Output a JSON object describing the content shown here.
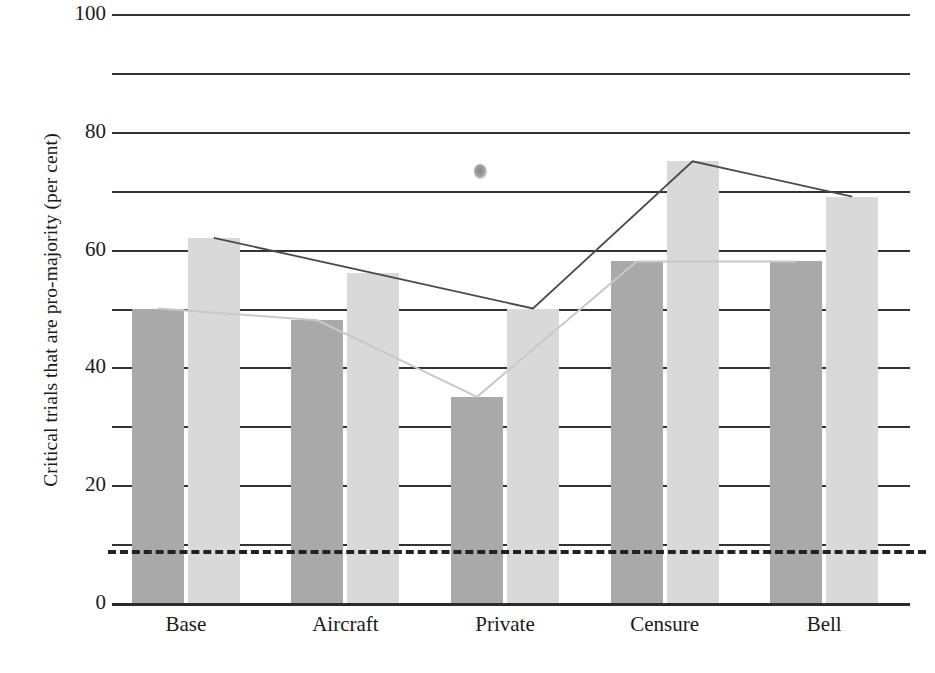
{
  "chart_data": {
    "type": "bar",
    "title": "",
    "subtitle": "",
    "xlabel": "",
    "ylabel": "Critical trials that are pro-majority (per cent)",
    "categories": [
      "Base",
      "Aircraft",
      "Private",
      "Censure",
      "Bell"
    ],
    "ylim": [
      0,
      100
    ],
    "y_major_ticks": [
      0,
      20,
      40,
      60,
      80,
      100
    ],
    "y_major_tick_labels": [
      "0",
      "20",
      "40",
      "60",
      "80",
      "100"
    ],
    "y_minor_gridlines": [
      10,
      30,
      50,
      70,
      90
    ],
    "grid": "horizontal gridlines every 10 units; major lines labelled every 20",
    "legend": "none shown",
    "series": [
      {
        "name": "series-a-dark",
        "color": "#a9a9a9",
        "values": [
          50,
          48,
          35,
          58,
          58
        ],
        "connector_line": "faint light-grey polyline joining the tops of the dark bars"
      },
      {
        "name": "series-b-light",
        "color": "#d9d9d9",
        "values": [
          62,
          56,
          50,
          75,
          69
        ],
        "connector_line": "dark thin polyline joining the tops of the light bars"
      }
    ],
    "reference_lines": [
      {
        "name": "chance-baseline",
        "value": 9,
        "style": "thick black dashed horizontal line spanning the plot width",
        "color": "#222222"
      }
    ],
    "annotations": [
      {
        "name": "print-smudge",
        "text": "",
        "note": "small dark ink smudge artifact above the Private light bar, around 74 per cent"
      }
    ]
  },
  "colors": {
    "series_a": "#a9a9a9",
    "series_b": "#d9d9d9",
    "gridline": "#333333",
    "axis": "#2b2b2b",
    "dashed_reference": "#222222",
    "connector_dark": "#4a4a4a",
    "connector_faint": "#c8c8c8",
    "background": "#ffffff",
    "text": "#1a1a1a"
  }
}
